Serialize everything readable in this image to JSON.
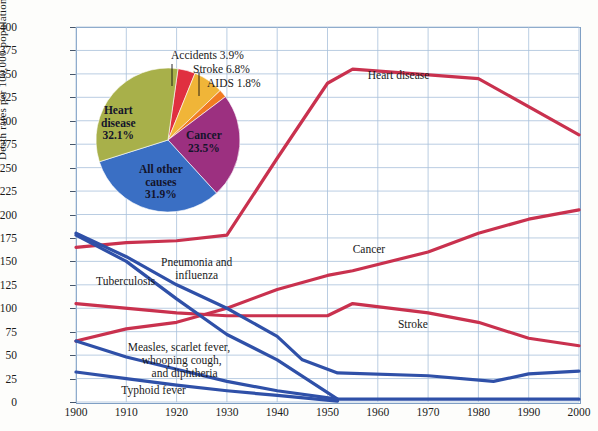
{
  "chart_data": {
    "type": "line",
    "title": "",
    "xlabel": "",
    "ylabel": "Death rates per 100,000 population",
    "xlim": [
      1900,
      2000
    ],
    "ylim": [
      0,
      400
    ],
    "ytick_step": 25,
    "grid": true,
    "legend_position": "inline-annotations",
    "xticks": [
      "1900",
      "1910",
      "1920",
      "1930",
      "1940",
      "1950",
      "1960",
      "1970",
      "1980",
      "1990",
      "2000"
    ],
    "yticks": [
      "0",
      "25",
      "50",
      "75",
      "100",
      "125",
      "150",
      "175",
      "200",
      "225",
      "250",
      "275",
      "300",
      "325",
      "350",
      "375",
      "400"
    ],
    "series": [
      {
        "name": "Heart disease",
        "color": "#c9314e",
        "label_x": 1958,
        "label_y": 348,
        "x": [
          1900,
          1910,
          1920,
          1930,
          1940,
          1950,
          1955,
          1980,
          2000
        ],
        "values": [
          165,
          170,
          172,
          178,
          260,
          340,
          355,
          345,
          285
        ]
      },
      {
        "name": "Cancer",
        "color": "#c9314e",
        "label_x": 1955,
        "label_y": 162,
        "x": [
          1900,
          1910,
          1920,
          1930,
          1940,
          1950,
          1955,
          1970,
          1980,
          1990,
          2000
        ],
        "values": [
          65,
          78,
          85,
          100,
          120,
          135,
          140,
          160,
          180,
          195,
          205
        ]
      },
      {
        "name": "Stroke",
        "color": "#c9314e",
        "label_x": 1964,
        "label_y": 82,
        "x": [
          1900,
          1920,
          1930,
          1940,
          1950,
          1955,
          1970,
          1980,
          1990,
          2000
        ],
        "values": [
          105,
          95,
          92,
          92,
          92,
          105,
          95,
          85,
          68,
          60
        ]
      },
      {
        "name": "Pneumonia and influenza",
        "color": "#2f50a8",
        "label_x": 1924,
        "label_y": 148,
        "x": [
          1900,
          1910,
          1920,
          1930,
          1940,
          1945,
          1952,
          1970,
          1983,
          1990,
          2000
        ],
        "values": [
          180,
          155,
          125,
          100,
          70,
          45,
          31,
          28,
          22,
          30,
          33
        ]
      },
      {
        "name": "Tuberculosis",
        "color": "#2f50a8",
        "label_x": 1904,
        "label_y": 128,
        "x": [
          1900,
          1910,
          1920,
          1930,
          1940,
          1952
        ],
        "values": [
          178,
          150,
          110,
          72,
          45,
          3
        ]
      },
      {
        "name": "Measles, scarlet fever, whooping cough, and diphtheria",
        "color": "#2f50a8",
        "label_x": 1912,
        "label_y": 58,
        "x": [
          1900,
          1910,
          1920,
          1930,
          1940,
          1952,
          1970,
          1985,
          2000
        ],
        "values": [
          65,
          48,
          35,
          22,
          12,
          3,
          3,
          3,
          3
        ]
      },
      {
        "name": "Typhoid fever",
        "color": "#2f50a8",
        "label_x": 1909,
        "label_y": 12,
        "x": [
          1900,
          1910,
          1920,
          1930,
          1940,
          1952
        ],
        "values": [
          32,
          25,
          18,
          12,
          7,
          1
        ]
      }
    ]
  },
  "pie_data": {
    "type": "pie",
    "center_x": 168,
    "center_y": 140,
    "radius": 72,
    "start_angle": -82,
    "slices": [
      {
        "name": "Accidents",
        "percent": 3.9,
        "label": "Accidents 3.9%",
        "color": "#e03040",
        "inside": false
      },
      {
        "name": "Stroke",
        "percent": 6.8,
        "label": "Stroke 6.8%",
        "color": "#f0b538",
        "inside": false
      },
      {
        "name": "AIDS",
        "percent": 1.8,
        "label": "AIDS 1.8%",
        "color": "#f07c22",
        "inside": false
      },
      {
        "name": "Cancer",
        "percent": 23.5,
        "label": "Cancer\n23.5%",
        "color": "#9c3080",
        "inside": true
      },
      {
        "name": "All other causes",
        "percent": 31.9,
        "label": "All other\ncauses\n31.9%",
        "color": "#3a6fc4",
        "inside": true
      },
      {
        "name": "Heart disease",
        "percent": 32.1,
        "label": "Heart\ndisease\n32.1%",
        "color": "#a8b04a",
        "inside": true
      }
    ],
    "callouts": [
      {
        "text": "Accidents 3.9%",
        "x": 171,
        "y": 49
      },
      {
        "text": "Stroke 6.8%",
        "x": 193,
        "y": 63
      },
      {
        "text": "AIDS 1.8%",
        "x": 207,
        "y": 77
      }
    ],
    "inside_labels": [
      {
        "lines": [
          "Heart",
          "disease",
          "32.1%"
        ],
        "x": 101,
        "y": 104
      },
      {
        "lines": [
          "Cancer",
          "23.5%"
        ],
        "x": 186,
        "y": 129
      },
      {
        "lines": [
          "All other",
          "causes",
          "31.9%"
        ],
        "x": 139,
        "y": 163
      }
    ]
  },
  "colors": {
    "red_line": "#c9314e",
    "blue_line": "#2f50a8",
    "grid": "#a8c0da",
    "axis": "#5a7a9e",
    "background": "#ffffff"
  }
}
